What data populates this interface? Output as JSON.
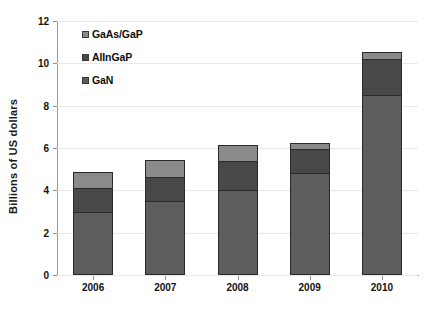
{
  "chart_data": {
    "type": "bar",
    "subtype": "stacked-vertical",
    "title": "",
    "xlabel": "",
    "ylabel": "Billions of US dollars",
    "ylim": [
      0,
      12
    ],
    "ytick_step": 2,
    "ytick_labels": [
      "0",
      "2",
      "4",
      "6",
      "8",
      "10",
      "12"
    ],
    "grid": true,
    "grid_axis": "y",
    "legend_position": "top-left-inside",
    "categories": [
      "2006",
      "2007",
      "2008",
      "2009",
      "2010"
    ],
    "series": [
      {
        "name": "GaN",
        "color": "#5d5d5d",
        "values": [
          3.0,
          3.5,
          4.0,
          4.8,
          8.5
        ]
      },
      {
        "name": "AlInGaP",
        "color": "#484848",
        "values": [
          1.1,
          1.15,
          1.4,
          1.15,
          1.7
        ]
      },
      {
        "name": "GaAs/GaP",
        "color": "#8a8a8a",
        "values": [
          0.75,
          0.8,
          0.75,
          0.3,
          0.35
        ]
      }
    ],
    "stack_order_bottom_to_top": [
      "GaN",
      "AlInGaP",
      "GaAs/GaP"
    ],
    "totals": [
      4.85,
      5.45,
      6.15,
      6.25,
      10.55
    ]
  },
  "legend": {
    "items": [
      {
        "label": "GaAs/GaP",
        "swatch_color": "#8a8a8a",
        "icon": "legend-swatch-icon"
      },
      {
        "label": "AlInGaP",
        "swatch_color": "#484848",
        "icon": "legend-swatch-icon"
      },
      {
        "label": "GaN",
        "swatch_color": "#5d5d5d",
        "icon": "legend-swatch-icon"
      }
    ]
  },
  "colors": {
    "background": "#ffffff",
    "axis": "#9a9a9a",
    "grid": "#e9e9e9",
    "bar_outline": "#2a2a2a",
    "text": "#111111"
  }
}
